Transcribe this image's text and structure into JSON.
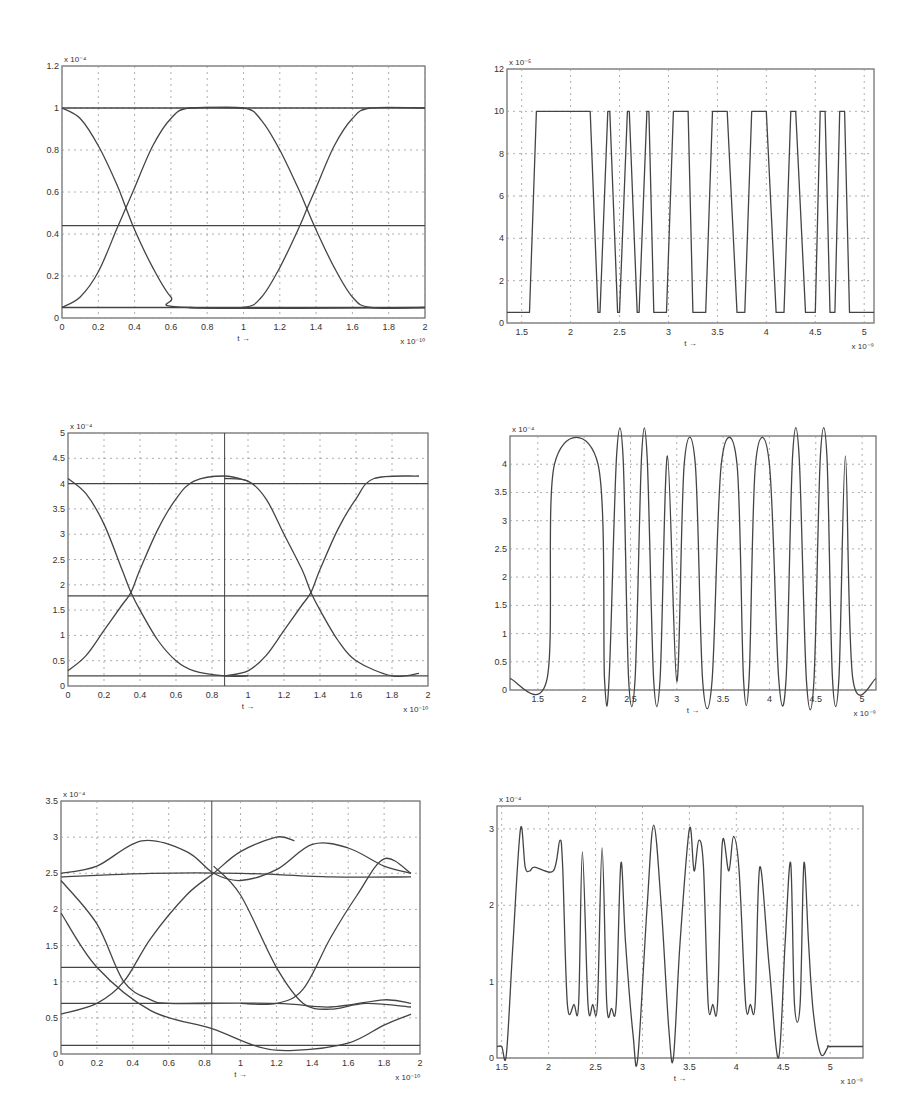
{
  "figure": {
    "panels": [
      {
        "id": "p1",
        "title": "Eye diagram - input"
      },
      {
        "id": "p2",
        "title": "Waveform - input"
      },
      {
        "id": "p3",
        "title": "Eye diagram - stage 2"
      },
      {
        "id": "p4",
        "title": "Waveform - stage 2"
      },
      {
        "id": "p5",
        "title": "Eye diagram - stage 3"
      },
      {
        "id": "p6",
        "title": "Waveform - stage 3"
      }
    ]
  },
  "chart_data": [
    {
      "id": "p1",
      "type": "line",
      "title": "",
      "xlabel": "t →",
      "ylabel": "",
      "x_multiplier": "x 10⁻¹⁰",
      "y_multiplier": "x 10⁻⁴",
      "xlim": [
        0,
        2
      ],
      "ylim": [
        0,
        1.2
      ],
      "xticks": [
        "0",
        "0.2",
        "0.4",
        "0.6",
        "0.8",
        "1",
        "1.2",
        "1.4",
        "1.6",
        "1.8",
        "2"
      ],
      "yticks": [
        "0",
        "0.2",
        "0.4",
        "0.6",
        "0.8",
        "1",
        "1.2"
      ],
      "grid": true,
      "series": [
        {
          "name": "high level",
          "x": [
            0,
            2
          ],
          "y": [
            1.0,
            1.0
          ]
        },
        {
          "name": "low level",
          "x": [
            0,
            2
          ],
          "y": [
            0.05,
            0.05
          ]
        },
        {
          "name": "threshold",
          "x": [
            0,
            2
          ],
          "y": [
            0.44,
            0.44
          ]
        },
        {
          "name": "falling 1",
          "x": [
            0,
            0.1,
            0.2,
            0.3,
            0.35,
            0.4,
            0.5,
            0.6,
            0.7,
            2
          ],
          "y": [
            1.0,
            0.95,
            0.82,
            0.64,
            0.53,
            0.42,
            0.24,
            0.1,
            0.05,
            0.05
          ]
        },
        {
          "name": "rising 1",
          "x": [
            0,
            0.1,
            0.2,
            0.3,
            0.35,
            0.4,
            0.5,
            0.6,
            0.7,
            1
          ],
          "y": [
            0.05,
            0.1,
            0.22,
            0.42,
            0.52,
            0.62,
            0.82,
            0.95,
            1.0,
            1.0
          ]
        },
        {
          "name": "falling 2",
          "x": [
            0.7,
            1.0,
            1.1,
            1.2,
            1.3,
            1.35,
            1.4,
            1.5,
            1.6,
            1.7,
            2
          ],
          "y": [
            1.0,
            1.0,
            0.94,
            0.8,
            0.62,
            0.52,
            0.42,
            0.24,
            0.1,
            0.05,
            0.05
          ]
        },
        {
          "name": "rising 2",
          "x": [
            0.7,
            1.0,
            1.1,
            1.2,
            1.3,
            1.35,
            1.4,
            1.5,
            1.6,
            1.7,
            2
          ],
          "y": [
            0.05,
            0.05,
            0.1,
            0.24,
            0.42,
            0.52,
            0.62,
            0.82,
            0.95,
            1.0,
            1.0
          ]
        }
      ]
    },
    {
      "id": "p2",
      "type": "line",
      "title": "",
      "xlabel": "t →",
      "ylabel": "",
      "x_multiplier": "x 10⁻⁹",
      "y_multiplier": "x 10⁻⁵",
      "xlim": [
        1.35,
        5.1
      ],
      "ylim": [
        0,
        12
      ],
      "xticks": [
        "1.5",
        "2",
        "2.5",
        "3",
        "3.5",
        "4",
        "4.5",
        "5"
      ],
      "yticks": [
        "0",
        "2",
        "4",
        "6",
        "8",
        "10",
        "12"
      ],
      "grid": true,
      "series": [
        {
          "name": "signal",
          "x": [
            1.35,
            1.58,
            1.65,
            2.2,
            2.28,
            2.3,
            2.38,
            2.4,
            2.48,
            2.5,
            2.58,
            2.6,
            2.68,
            2.7,
            2.78,
            2.8,
            2.85,
            2.98,
            3.05,
            3.2,
            3.25,
            3.38,
            3.45,
            3.6,
            3.7,
            3.78,
            3.85,
            4.0,
            4.1,
            4.18,
            4.25,
            4.3,
            4.4,
            4.5,
            4.55,
            4.6,
            4.65,
            4.7,
            4.75,
            4.8,
            4.85,
            5.1
          ],
          "y": [
            0.5,
            0.5,
            10,
            10,
            0.5,
            0.5,
            10,
            10,
            0.5,
            0.5,
            10,
            10,
            0.5,
            0.5,
            10,
            10,
            0.5,
            0.5,
            10,
            10,
            0.5,
            0.5,
            10,
            10,
            0.5,
            0.5,
            10,
            10,
            0.5,
            0.5,
            10,
            10,
            0.5,
            0.5,
            10,
            10,
            0.5,
            0.5,
            10,
            10,
            0.5,
            0.5
          ]
        }
      ]
    },
    {
      "id": "p3",
      "type": "line",
      "title": "",
      "xlabel": "t →",
      "ylabel": "",
      "x_multiplier": "x 10⁻¹⁰",
      "y_multiplier": "x 10⁻⁴",
      "xlim": [
        0,
        2
      ],
      "ylim": [
        0,
        5
      ],
      "xticks": [
        "0",
        "0.2",
        "0.4",
        "0.6",
        "0.8",
        "1",
        "1.2",
        "1.4",
        "1.6",
        "1.8",
        "2"
      ],
      "yticks": [
        "0",
        "0.5",
        "1",
        "1.5",
        "2",
        "2.5",
        "3",
        "3.5",
        "4",
        "4.5",
        "5"
      ],
      "grid": true,
      "cursor_x": 0.87,
      "series": [
        {
          "name": "high level",
          "x": [
            0,
            2
          ],
          "y": [
            4.0,
            4.0
          ]
        },
        {
          "name": "low level",
          "x": [
            0,
            2
          ],
          "y": [
            0.2,
            0.2
          ]
        },
        {
          "name": "threshold",
          "x": [
            0,
            2
          ],
          "y": [
            1.78,
            1.78
          ]
        },
        {
          "name": "falling 1",
          "x": [
            0,
            0.1,
            0.2,
            0.3,
            0.35,
            0.4,
            0.5,
            0.6,
            0.7,
            0.87,
            1.0
          ],
          "y": [
            4.1,
            3.8,
            3.2,
            2.3,
            1.85,
            1.5,
            0.9,
            0.5,
            0.3,
            0.2,
            0.2
          ]
        },
        {
          "name": "rising 1",
          "x": [
            0,
            0.1,
            0.2,
            0.3,
            0.35,
            0.4,
            0.5,
            0.6,
            0.7,
            0.87,
            1.0
          ],
          "y": [
            0.3,
            0.6,
            1.1,
            1.6,
            1.85,
            2.3,
            3.1,
            3.7,
            4.05,
            4.15,
            4.05
          ]
        },
        {
          "name": "falling 2",
          "x": [
            0.87,
            1.0,
            1.1,
            1.2,
            1.3,
            1.35,
            1.4,
            1.5,
            1.6,
            1.8,
            1.95
          ],
          "y": [
            4.1,
            4.05,
            3.7,
            3.0,
            2.3,
            1.85,
            1.5,
            0.9,
            0.5,
            0.2,
            0.25
          ]
        },
        {
          "name": "rising 2",
          "x": [
            0.87,
            1.0,
            1.1,
            1.2,
            1.3,
            1.35,
            1.4,
            1.5,
            1.6,
            1.7,
            1.95
          ],
          "y": [
            0.2,
            0.3,
            0.6,
            1.1,
            1.6,
            1.85,
            2.3,
            3.1,
            3.7,
            4.1,
            4.15
          ]
        }
      ]
    },
    {
      "id": "p4",
      "type": "line",
      "title": "",
      "xlabel": "t →",
      "ylabel": "",
      "x_multiplier": "x 10⁻⁹",
      "y_multiplier": "x 10⁻⁴",
      "xlim": [
        1.2,
        5.15
      ],
      "ylim": [
        0,
        4.5
      ],
      "xticks": [
        "1.5",
        "2",
        "2.5",
        "3",
        "3.5",
        "4",
        "4.5",
        "5"
      ],
      "yticks": [
        "0",
        "0.5",
        "1",
        "1.5",
        "2",
        "2.5",
        "3",
        "3.5",
        "4"
      ],
      "grid": true,
      "series": [
        {
          "name": "signal",
          "x": [
            1.2,
            1.6,
            1.68,
            2.15,
            2.22,
            2.27,
            2.35,
            2.42,
            2.48,
            2.55,
            2.62,
            2.68,
            2.75,
            2.82,
            2.9,
            3.0,
            3.08,
            3.2,
            3.28,
            3.38,
            3.48,
            3.65,
            3.72,
            3.78,
            3.85,
            4.0,
            4.1,
            4.18,
            4.25,
            4.32,
            4.4,
            4.48,
            4.55,
            4.62,
            4.68,
            4.75,
            4.82,
            4.9,
            5.15
          ],
          "y": [
            0.2,
            0.2,
            4.0,
            4.0,
            0.2,
            0.2,
            4.15,
            4.15,
            0.2,
            0.2,
            4.15,
            4.15,
            0.2,
            0.2,
            4.15,
            0.15,
            4.0,
            4.0,
            0.15,
            0.15,
            4.0,
            4.0,
            0.2,
            0.2,
            4.0,
            4.0,
            0.2,
            0.2,
            4.15,
            4.15,
            0.15,
            0.15,
            4.15,
            4.15,
            0.2,
            0.2,
            4.15,
            0.2,
            0.2
          ]
        }
      ]
    },
    {
      "id": "p5",
      "type": "line",
      "title": "",
      "xlabel": "t →",
      "ylabel": "",
      "x_multiplier": "x 10⁻¹⁰",
      "y_multiplier": "x 10⁻⁴",
      "xlim": [
        0,
        2
      ],
      "ylim": [
        0,
        3.5
      ],
      "xticks": [
        "0",
        "0.2",
        "0.4",
        "0.6",
        "0.8",
        "1",
        "1.2",
        "1.4",
        "1.6",
        "1.8",
        "2"
      ],
      "yticks": [
        "0",
        "0.5",
        "1",
        "1.5",
        "2",
        "2.5",
        "3",
        "3.5"
      ],
      "grid": true,
      "cursor_x": 0.84,
      "series": [
        {
          "name": "threshold",
          "x": [
            0,
            2
          ],
          "y": [
            1.2,
            1.2
          ]
        },
        {
          "name": "upper bundle",
          "x": [
            0,
            0.2,
            0.45,
            0.7,
            0.85,
            1.0,
            1.2,
            1.4,
            1.6,
            1.8,
            1.95
          ],
          "y": [
            2.5,
            2.6,
            2.95,
            2.8,
            2.5,
            2.4,
            2.55,
            2.9,
            2.85,
            2.6,
            2.5
          ]
        },
        {
          "name": "upper flat",
          "x": [
            0,
            0.5,
            1.0,
            1.5,
            1.95
          ],
          "y": [
            2.45,
            2.5,
            2.5,
            2.45,
            2.45
          ]
        },
        {
          "name": "mid flat",
          "x": [
            0,
            0.6,
            1.2,
            1.5,
            1.8,
            1.95
          ],
          "y": [
            0.7,
            0.7,
            0.7,
            0.65,
            0.75,
            0.7
          ]
        },
        {
          "name": "low flat",
          "x": [
            0,
            2
          ],
          "y": [
            0.12,
            0.12
          ]
        },
        {
          "name": "falling 1",
          "x": [
            0,
            0.2,
            0.35,
            0.5,
            0.6,
            0.85
          ],
          "y": [
            2.4,
            1.8,
            1.0,
            0.75,
            0.7,
            0.7
          ]
        },
        {
          "name": "rising 1",
          "x": [
            0,
            0.2,
            0.35,
            0.5,
            0.7,
            0.85,
            1.0,
            1.2,
            1.3
          ],
          "y": [
            0.55,
            0.7,
            1.0,
            1.6,
            2.2,
            2.5,
            2.8,
            3.0,
            2.95
          ]
        },
        {
          "name": "falling 2",
          "x": [
            0.85,
            1.0,
            1.2,
            1.35,
            1.5,
            1.7,
            1.95
          ],
          "y": [
            2.6,
            2.2,
            1.2,
            0.7,
            0.62,
            0.7,
            0.65
          ]
        },
        {
          "name": "rising 2",
          "x": [
            1.0,
            1.2,
            1.35,
            1.5,
            1.65,
            1.8,
            1.95
          ],
          "y": [
            0.7,
            0.7,
            0.9,
            1.6,
            2.2,
            2.7,
            2.5
          ]
        },
        {
          "name": "low swing",
          "x": [
            0,
            0.2,
            0.5,
            0.84,
            1.1,
            1.3,
            1.6,
            1.8,
            1.95
          ],
          "y": [
            1.95,
            1.2,
            0.6,
            0.35,
            0.1,
            0.05,
            0.15,
            0.4,
            0.55
          ]
        }
      ]
    },
    {
      "id": "p6",
      "type": "line",
      "title": "",
      "xlabel": "t →",
      "ylabel": "",
      "x_multiplier": "x 10⁻⁹",
      "y_multiplier": "x 10⁻⁴",
      "xlim": [
        1.45,
        5.35
      ],
      "ylim": [
        0,
        3.3
      ],
      "xticks": [
        "1.5",
        "2",
        "2.5",
        "3",
        "3.5",
        "4",
        "4.5",
        "5"
      ],
      "yticks": [
        "0",
        "1",
        "2",
        "3"
      ],
      "grid": true,
      "series": [
        {
          "name": "signal",
          "x": [
            1.45,
            1.5,
            1.55,
            1.62,
            1.7,
            1.75,
            1.8,
            1.85,
            2.05,
            2.12,
            2.15,
            2.2,
            2.27,
            2.32,
            2.36,
            2.42,
            2.47,
            2.52,
            2.57,
            2.62,
            2.67,
            2.72,
            2.77,
            2.82,
            2.9,
            2.95,
            3.05,
            3.12,
            3.2,
            3.28,
            3.33,
            3.4,
            3.5,
            3.55,
            3.6,
            3.65,
            3.7,
            3.75,
            3.8,
            3.85,
            3.92,
            3.97,
            4.03,
            4.1,
            4.15,
            4.2,
            4.25,
            4.35,
            4.45,
            4.52,
            4.58,
            4.62,
            4.68,
            4.72,
            4.77,
            4.82,
            4.9,
            4.98,
            5.0,
            5.35
          ],
          "y": [
            0.15,
            0.15,
            0.05,
            1.5,
            3.0,
            2.5,
            2.45,
            2.5,
            2.45,
            2.85,
            2.5,
            0.7,
            0.7,
            0.7,
            2.7,
            0.7,
            0.7,
            0.7,
            2.75,
            0.7,
            0.65,
            0.7,
            2.55,
            1.5,
            0.3,
            0.0,
            2.0,
            3.05,
            2.0,
            0.4,
            0.0,
            1.5,
            3.0,
            2.45,
            2.85,
            2.5,
            0.7,
            0.7,
            0.7,
            2.8,
            2.45,
            2.9,
            2.45,
            0.7,
            0.7,
            0.7,
            2.5,
            1.2,
            0.0,
            1.5,
            2.55,
            0.7,
            0.7,
            2.55,
            1.5,
            0.6,
            0.05,
            0.15,
            0.15,
            0.15
          ]
        }
      ]
    }
  ]
}
